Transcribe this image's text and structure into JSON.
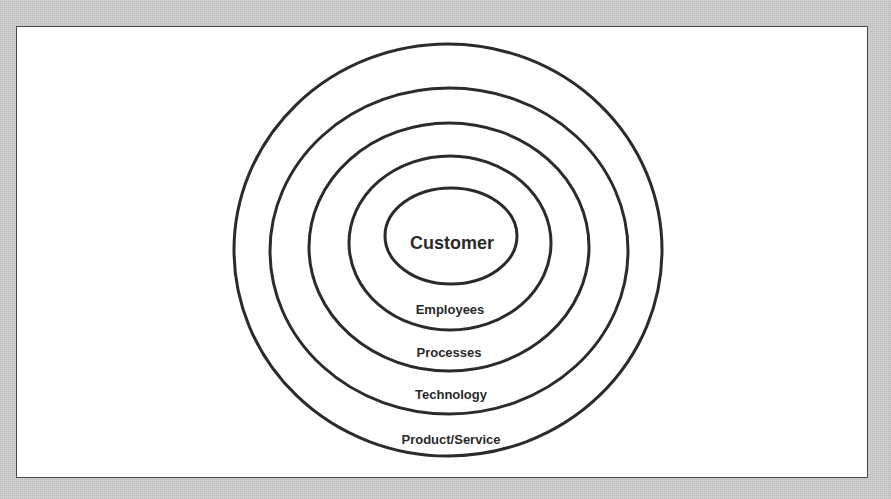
{
  "diagram": {
    "type": "concentric-ellipses",
    "colors": {
      "background": "#c9c9c9",
      "panel": "#ffffff",
      "stroke": "#2b2b2b",
      "text": "#2a2a2a"
    },
    "center_label": "Customer",
    "rings": [
      {
        "label": "Employees",
        "order": 1
      },
      {
        "label": "Processes",
        "order": 2
      },
      {
        "label": "Technology",
        "order": 3
      },
      {
        "label": "Product/Service",
        "order": 4
      }
    ]
  }
}
